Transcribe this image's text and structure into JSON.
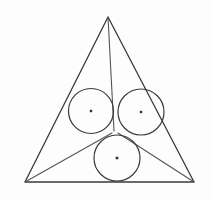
{
  "figure": {
    "background_color": "#fdfdfd",
    "stroke_color": "#3a3a3a",
    "stroke_color_light": "#555555",
    "fill_color": "none",
    "canvas": {
      "width": 214,
      "height": 199
    }
  },
  "outer_triangle": {
    "name": "outer-triangle",
    "stroke_width": 1.3,
    "vertices": [
      {
        "label": "apex",
        "x": 108,
        "y": 17
      },
      {
        "label": "bottom-left",
        "x": 25,
        "y": 182
      },
      {
        "label": "bottom-right",
        "x": 194,
        "y": 182
      }
    ],
    "points_attr": "108,17 25,182 194,182"
  },
  "inner_triangle": {
    "name": "inner-triangle",
    "stroke_width": 1.1,
    "description": "Lines from the three outer vertices meeting at the central tangency junction",
    "junction": {
      "x": 115,
      "y": 133
    },
    "segments": [
      {
        "name": "apex-to-junction",
        "x1": 108,
        "y1": 17,
        "x2": 114,
        "y2": 131
      },
      {
        "name": "bottom-left-to-junction",
        "x1": 25,
        "y1": 182,
        "x2": 112,
        "y2": 133
      },
      {
        "name": "bottom-right-to-junction",
        "x1": 194,
        "y1": 182,
        "x2": 118,
        "y2": 133
      }
    ]
  },
  "circles": [
    {
      "name": "circle-left",
      "cx": 91,
      "cy": 111,
      "r": 22.5,
      "stroke_width": 1.2,
      "center_dot": {
        "x": 91,
        "y": 111,
        "size": 2.4
      }
    },
    {
      "name": "circle-right",
      "cx": 141,
      "cy": 112,
      "r": 23,
      "stroke_width": 1.2,
      "center_dot": {
        "x": 141,
        "y": 112,
        "size": 2.4
      }
    },
    {
      "name": "circle-bottom",
      "cx": 117,
      "cy": 158,
      "r": 23,
      "stroke_width": 1.2,
      "center_dot": {
        "x": 117,
        "y": 158,
        "size": 2.6
      }
    }
  ],
  "labels": {
    "visible_text": []
  }
}
